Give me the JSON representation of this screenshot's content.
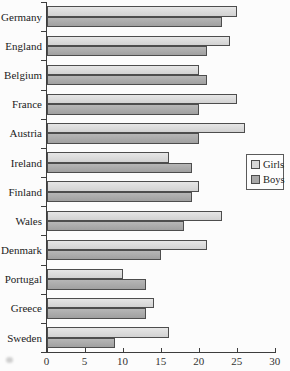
{
  "chart_data": {
    "type": "bar",
    "orientation": "horizontal",
    "categories": [
      "Germany",
      "England",
      "Belgium",
      "France",
      "Austria",
      "Ireland",
      "Finland",
      "Wales",
      "Denmark",
      "Portugal",
      "Greece",
      "Sweden"
    ],
    "series": [
      {
        "name": "Girls",
        "color_top": "#e6e6e6",
        "color": "#d8d8d8",
        "values": [
          25,
          24,
          20,
          25,
          26,
          16,
          20,
          23,
          21,
          10,
          14,
          16
        ]
      },
      {
        "name": "Boys",
        "color_top": "#b6b6b6",
        "color": "#a9a9a9",
        "values": [
          23,
          21,
          21,
          20,
          20,
          19,
          19,
          18,
          15,
          13,
          13,
          9
        ]
      }
    ],
    "x_ticks": [
      "0",
      "5",
      "10",
      "15",
      "20",
      "25",
      "30"
    ],
    "xlim": [
      0,
      30
    ],
    "grid": false,
    "legend_position": "middle-right",
    "bar_border_color": "#4d4d4d",
    "axis_color": "#3d3d3d",
    "background": "#fcfcfc"
  }
}
